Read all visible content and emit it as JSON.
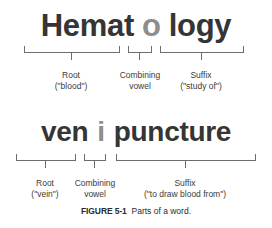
{
  "figure": {
    "caption_label": "FIGURE 5-1",
    "caption_text": "Parts of a word.",
    "colors": {
      "background": "#ffffff",
      "word_dark": "#353535",
      "word_light": "#8e8e8e",
      "bracket": "#6d6d6d",
      "label_text": "#3a3a3a"
    }
  },
  "examples": [
    {
      "id": "hematology",
      "word": "Hematology",
      "segments": [
        {
          "text": "Hemat",
          "tone": "dark"
        },
        {
          "text": "o",
          "tone": "light"
        },
        {
          "text": "logy",
          "tone": "dark"
        }
      ],
      "parts": [
        {
          "name": "Root",
          "detail": "(\"blood\")"
        },
        {
          "name": "Combining",
          "detail": "vowel"
        },
        {
          "name": "Suffix",
          "detail": "(\"study of\")"
        }
      ]
    },
    {
      "id": "venipuncture",
      "word": "venipuncture",
      "segments": [
        {
          "text": "ven",
          "tone": "dark"
        },
        {
          "text": "i",
          "tone": "light"
        },
        {
          "text": "puncture",
          "tone": "dark"
        }
      ],
      "parts": [
        {
          "name": "Root",
          "detail": "(\"vein\")"
        },
        {
          "name": "Combining",
          "detail": "vowel"
        },
        {
          "name": "Suffix",
          "detail": "(\"to draw blood from\")"
        }
      ]
    }
  ]
}
